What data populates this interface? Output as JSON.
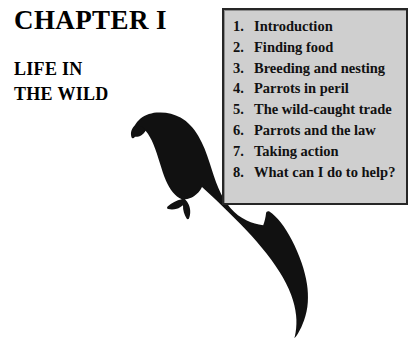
{
  "page": {
    "background_color": "#ffffff",
    "chapter_title": "CHAPTER I",
    "subtitle_line_1": "LIFE IN",
    "subtitle_line_2": "THE WILD"
  },
  "contents_box": {
    "fill_color": "#cfcfcf",
    "border_color": "#262626",
    "items": [
      {
        "number": "1.",
        "label": "Introduction"
      },
      {
        "number": "2.",
        "label": "Finding food"
      },
      {
        "number": "3.",
        "label": "Breeding and nesting"
      },
      {
        "number": "4.",
        "label": "Parrots in peril"
      },
      {
        "number": "5.",
        "label": "The wild-caught trade"
      },
      {
        "number": "6.",
        "label": "Parrots and the law"
      },
      {
        "number": "7.",
        "label": "Taking action"
      },
      {
        "number": "8.",
        "label": "What can I do to help?"
      }
    ]
  },
  "illustration": {
    "name": "parrot-silhouette",
    "fill_color": "#111111",
    "description": "Black silhouette of a long-tailed parrot perched, facing left"
  }
}
